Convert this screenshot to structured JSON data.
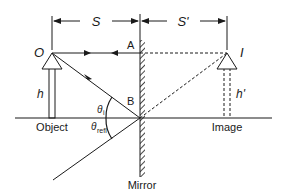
{
  "labels": {
    "distance_object": "S",
    "distance_image": "S'",
    "object_point": "O",
    "image_point": "I",
    "point_a": "A",
    "point_b": "B",
    "object_height": "h",
    "image_height": "h'",
    "object_caption": "Object",
    "image_caption": "Image",
    "mirror_caption": "Mirror",
    "theta": "θ",
    "theta_i_sub": "i",
    "theta_refl_sub": "refl"
  },
  "colors": {
    "line": "#1a1a1a",
    "background": "#ffffff"
  }
}
